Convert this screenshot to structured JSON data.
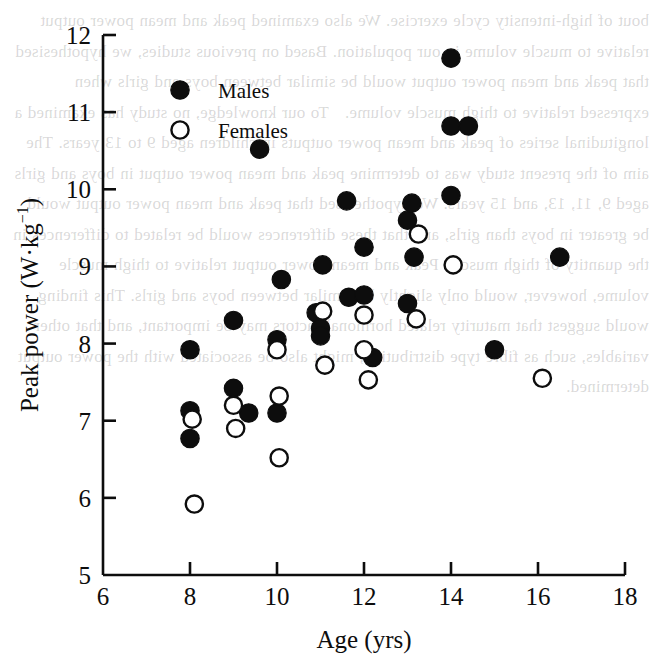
{
  "figure": {
    "background_color": "#ffffff",
    "ink_color": "#0d0d0d",
    "bleed_through_text": "bout of high-intensity cycle exercise. We also examined peak and mean power output relative to muscle volume in our population. Based on previous studies, we hypothesised that peak and mean power output would be similar between boys and girls when expressed relative to thigh muscle volume.   To our knowledge, no study has examined a longitudinal series of peak and mean power outputs in children aged 9 to 13 years. The aim of the present study was to determine peak and mean power output in boys and girls aged 9, 11, 13, and 15 years. We hypothesised that peak and mean power output would be greater in boys than girls, and that these differences would be related to differences in the quantity of thigh muscle. Peak and mean power output relative to thigh muscle volume, however, would only slightly be similar between boys and girls. This finding would suggest that maturity related hormonal factors may be important, and that other variables, such as fibre type distribution, might also be associated with the power output determined."
  },
  "chart_data": {
    "type": "scatter",
    "title": "",
    "xlabel": "Age (yrs)",
    "ylabel": "Peak power (W·kg⁻¹)",
    "ylabel_parts": {
      "main": "Peak power (W·kg",
      "superscript": "−1",
      "tail": ")"
    },
    "xlim": [
      6,
      18
    ],
    "ylim": [
      5,
      12
    ],
    "xticks": [
      6,
      8,
      10,
      12,
      14,
      16,
      18
    ],
    "yticks": [
      5,
      6,
      7,
      8,
      9,
      10,
      11,
      12
    ],
    "grid": false,
    "legend_position": "top-left-inside",
    "legend": [
      {
        "name": "Males",
        "marker": "filled-circle",
        "color": "#0d0d0d"
      },
      {
        "name": "Females",
        "marker": "open-circle",
        "color": "#0d0d0d"
      }
    ],
    "series": [
      {
        "name": "Males",
        "marker": "filled-circle",
        "color": "#0d0d0d",
        "points": [
          [
            8.0,
            7.92
          ],
          [
            8.0,
            7.13
          ],
          [
            8.0,
            6.77
          ],
          [
            9.0,
            8.3
          ],
          [
            9.0,
            7.42
          ],
          [
            9.35,
            7.1
          ],
          [
            9.6,
            10.52
          ],
          [
            10.0,
            8.05
          ],
          [
            10.0,
            7.1
          ],
          [
            10.1,
            8.83
          ],
          [
            10.9,
            8.4
          ],
          [
            11.0,
            8.2
          ],
          [
            11.0,
            8.1
          ],
          [
            11.05,
            9.02
          ],
          [
            11.6,
            9.85
          ],
          [
            11.65,
            8.6
          ],
          [
            12.0,
            8.63
          ],
          [
            12.0,
            9.25
          ],
          [
            12.2,
            7.82
          ],
          [
            13.0,
            9.6
          ],
          [
            13.0,
            8.52
          ],
          [
            13.1,
            9.82
          ],
          [
            13.15,
            9.12
          ],
          [
            14.0,
            11.7
          ],
          [
            14.0,
            10.82
          ],
          [
            14.0,
            9.92
          ],
          [
            14.4,
            10.82
          ],
          [
            15.0,
            7.92
          ],
          [
            16.5,
            9.12
          ]
        ]
      },
      {
        "name": "Females",
        "marker": "open-circle",
        "color": "#0d0d0d",
        "points": [
          [
            8.05,
            7.02
          ],
          [
            8.1,
            5.92
          ],
          [
            9.0,
            7.2
          ],
          [
            9.05,
            6.9
          ],
          [
            10.0,
            7.92
          ],
          [
            10.05,
            7.32
          ],
          [
            10.05,
            6.52
          ],
          [
            11.05,
            8.42
          ],
          [
            11.1,
            7.72
          ],
          [
            12.0,
            8.37
          ],
          [
            12.0,
            7.92
          ],
          [
            12.1,
            7.53
          ],
          [
            13.2,
            8.32
          ],
          [
            13.25,
            9.42
          ],
          [
            14.05,
            9.02
          ],
          [
            16.1,
            7.55
          ]
        ]
      }
    ]
  }
}
